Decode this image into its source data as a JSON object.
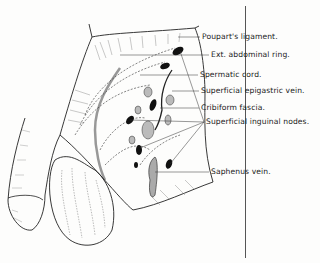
{
  "figure": {
    "labels": [
      {
        "id": "pouparts-ligament",
        "text": "Poupart's ligament.",
        "x": 202,
        "y": 37
      },
      {
        "id": "ext-abdominal-ring",
        "text": "Ext. abdominal ring.",
        "x": 211,
        "y": 55
      },
      {
        "id": "spermatic-cord",
        "text": "Spermatic cord.",
        "x": 200,
        "y": 75
      },
      {
        "id": "superficial-epigastric-vein",
        "text": "Superficial epigastric vein.",
        "x": 201,
        "y": 91
      },
      {
        "id": "cribiform-fascia",
        "text": "Cribiform fascia.",
        "x": 201,
        "y": 108
      },
      {
        "id": "superficial-inguinal-nodes",
        "text": "Superficial inguinal nodes.",
        "x": 206,
        "y": 122
      },
      {
        "id": "saphenus-vein",
        "text": "Saphenus vein.",
        "x": 211,
        "y": 172
      }
    ]
  },
  "colors": {
    "ink": "#1e1e1e",
    "paper": "#fdfdfc",
    "shade": "#8a8a8a"
  }
}
